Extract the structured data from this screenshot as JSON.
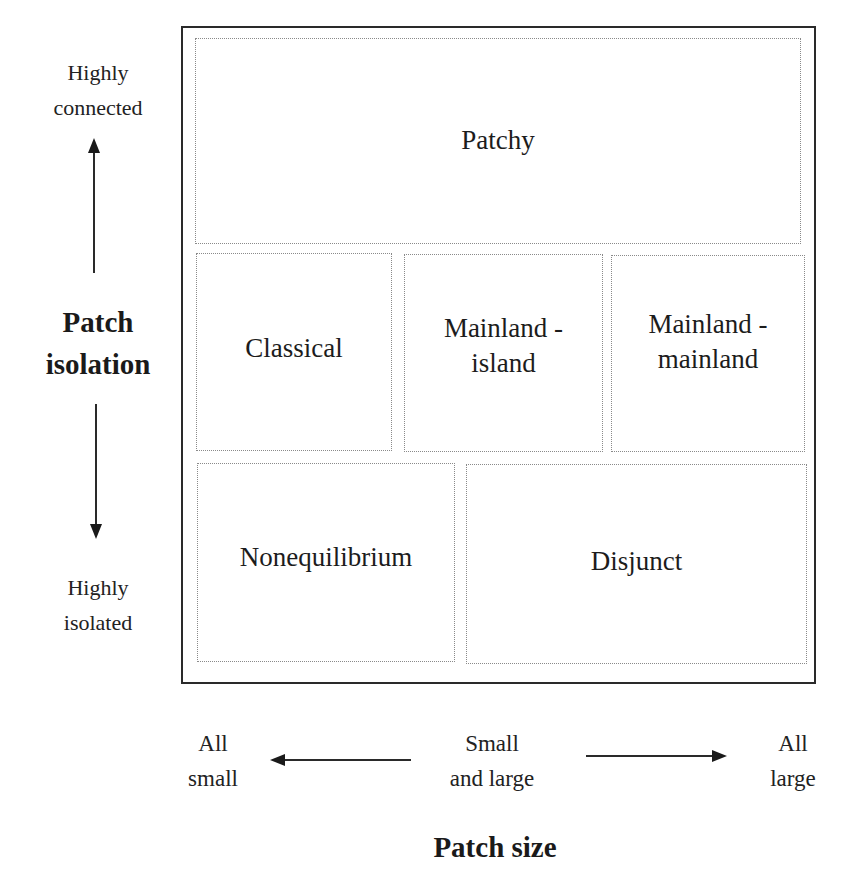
{
  "diagram": {
    "type": "conceptual-grid",
    "regions": [
      {
        "id": "patchy",
        "label": "Patchy"
      },
      {
        "id": "classical",
        "label": "Classical"
      },
      {
        "id": "mainland-island",
        "label_line1": "Mainland -",
        "label_line2": "island"
      },
      {
        "id": "mainland-mainland",
        "label_line1": "Mainland -",
        "label_line2": "mainland"
      },
      {
        "id": "nonequilibrium",
        "label": "Nonequilibrium"
      },
      {
        "id": "disjunct",
        "label": "Disjunct"
      }
    ],
    "y_axis": {
      "title_line1": "Patch",
      "title_line2": "isolation",
      "top_label_line1": "Highly",
      "top_label_line2": "connected",
      "bottom_label_line1": "Highly",
      "bottom_label_line2": "isolated",
      "arrows": [
        "up-arrow",
        "down-arrow"
      ]
    },
    "x_axis": {
      "title": "Patch size",
      "left_label_line1": "All",
      "left_label_line2": "small",
      "center_label_line1": "Small",
      "center_label_line2": "and large",
      "right_label_line1": "All",
      "right_label_line2": "large",
      "arrows": [
        "left-arrow",
        "right-arrow"
      ]
    },
    "colors": {
      "outer_border": "#2a2a2a",
      "dotted_border": "#8a8a8a",
      "text": "#1a1a1a",
      "background": "#ffffff"
    }
  }
}
